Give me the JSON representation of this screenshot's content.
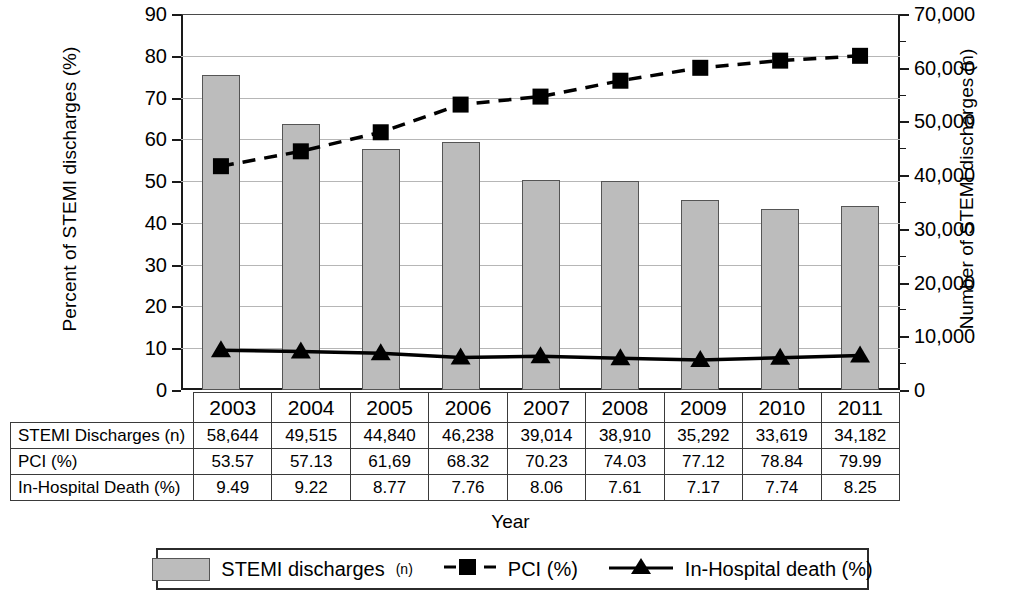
{
  "chart_data": {
    "type": "bar",
    "title": "",
    "xlabel": "Year",
    "ylabel": "Percent of STEMI discharges (%)",
    "ylabel_right": "Number of STEMI discharges (n)",
    "categories": [
      "2003",
      "2004",
      "2005",
      "2006",
      "2007",
      "2008",
      "2009",
      "2010",
      "2011"
    ],
    "ylim": [
      0,
      90
    ],
    "yticks": [
      0,
      10,
      20,
      30,
      40,
      50,
      60,
      70,
      80,
      90
    ],
    "ylim_right": [
      0,
      70000
    ],
    "yticks_right": [
      "0",
      "10,000",
      "20,000",
      "30,000",
      "40,000",
      "50,000",
      "60,000",
      "70,000"
    ],
    "grid": true,
    "legend_position": "bottom",
    "series": [
      {
        "name": "STEMI discharges (n)",
        "type": "bar",
        "axis": "right",
        "values": [
          58644,
          49515,
          44840,
          46238,
          39014,
          38910,
          35292,
          33619,
          34182
        ]
      },
      {
        "name": "PCI (%)",
        "type": "line",
        "axis": "left",
        "marker": "square",
        "linestyle": "dashed",
        "values": [
          53.57,
          57.13,
          61.69,
          68.32,
          70.23,
          74.03,
          77.12,
          78.84,
          79.99
        ]
      },
      {
        "name": "In-Hospital death (%)",
        "type": "line",
        "axis": "left",
        "marker": "triangle",
        "linestyle": "solid",
        "values": [
          9.49,
          9.22,
          8.77,
          7.76,
          8.06,
          7.61,
          7.17,
          7.74,
          8.25
        ]
      }
    ]
  },
  "axes": {
    "left_title": "Percent of STEMI discharges (%)",
    "right_title": "Number of STEMI discharges (n)",
    "x_title": "Year",
    "left_ticks": [
      "90",
      "80",
      "70",
      "60",
      "50",
      "40",
      "30",
      "20",
      "10",
      "0"
    ],
    "right_ticks": [
      "70,000",
      "60,000",
      "50,000",
      "40,000",
      "30,000",
      "20,000",
      "10,000",
      "0"
    ]
  },
  "table": {
    "years": [
      "2003",
      "2004",
      "2005",
      "2006",
      "2007",
      "2008",
      "2009",
      "2010",
      "2011"
    ],
    "rows": [
      {
        "label": "STEMI Discharges (n)",
        "values": [
          "58,644",
          "49,515",
          "44,840",
          "46,238",
          "39,014",
          "38,910",
          "35,292",
          "33,619",
          "34,182"
        ]
      },
      {
        "label": "PCI (%)",
        "values": [
          "53.57",
          "57.13",
          "61,69",
          "68.32",
          "70.23",
          "74.03",
          "77.12",
          "78.84",
          "79.99"
        ]
      },
      {
        "label": "In-Hospital Death (%)",
        "values": [
          "9.49",
          "9.22",
          "8.77",
          "7.76",
          "8.06",
          "7.61",
          "7.17",
          "7.74",
          "8.25"
        ]
      }
    ]
  },
  "legend": {
    "items": [
      {
        "label": "STEMI discharges ",
        "sub": "(n)",
        "marker": "bar-swatch"
      },
      {
        "label": "PCI (%)",
        "sub": "",
        "marker": "dashed-square"
      },
      {
        "label": "In-Hospital death (%)",
        "sub": "",
        "marker": "solid-triangle"
      }
    ]
  },
  "colors": {
    "bar_fill": "#bcbcbc",
    "bar_edge": "#555555",
    "line": "#000000",
    "grid": "#b6b6b6"
  }
}
